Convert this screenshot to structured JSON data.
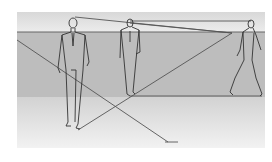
{
  "figure": {
    "colors": {
      "background": "#ffffff",
      "sky_band": "#e4e4e4",
      "ground_mid": "#bdbdbd",
      "ground_near": "#e8e8e8",
      "line": "#555555",
      "figure_stroke": "#333333"
    },
    "frame": {
      "x": 17,
      "y": 12,
      "w": 248,
      "h": 136
    },
    "horizon_y": 32,
    "vanishing_point": {
      "x": 232,
      "y": 33
    },
    "figures": [
      {
        "name": "near-man-standing",
        "head": [
          73,
          22
        ],
        "feet": [
          75,
          127
        ]
      },
      {
        "name": "middle-man-standing",
        "head": [
          130,
          22
        ],
        "feet": [
          130,
          96
        ]
      },
      {
        "name": "far-man-walking",
        "head": [
          251,
          22
        ],
        "feet": [
          245,
          96
        ]
      }
    ]
  }
}
